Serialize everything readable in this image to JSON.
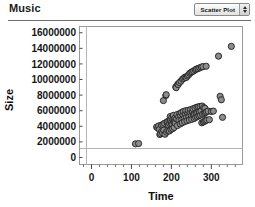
{
  "header": {
    "title": "Music",
    "plot_type": {
      "selected": "Scatter Plot",
      "stepper_up_icon": "triangle-up-icon",
      "stepper_down_icon": "triangle-down-icon"
    }
  },
  "chart_data": {
    "type": "scatter",
    "title": "Music",
    "xlabel": "Time",
    "ylabel": "Size",
    "xlim": [
      -30,
      378
    ],
    "ylim": [
      -900000,
      16800000
    ],
    "xticks": [
      0,
      100,
      200,
      300
    ],
    "xtick_labels": [
      "0",
      "100",
      "200",
      "300"
    ],
    "yticks": [
      0,
      2000000,
      4000000,
      6000000,
      8000000,
      10000000,
      12000000,
      14000000,
      16000000
    ],
    "ytick_labels": [
      "0",
      "2000000",
      "4000000",
      "6000000",
      "8000000",
      "10000000",
      "12000000",
      "14000000",
      "16000000"
    ],
    "grid": false,
    "zero_line": true,
    "legend": null,
    "marker": {
      "shape": "circle",
      "fill": "#8c8c8c",
      "edge": "#1f1f1f",
      "size": 3.1
    },
    "points": [
      [
        110,
        1750000
      ],
      [
        118,
        1790000
      ],
      [
        163,
        3900000
      ],
      [
        166,
        3780000
      ],
      [
        168,
        4050000
      ],
      [
        170,
        3600000
      ],
      [
        171,
        2950000
      ],
      [
        173,
        3050000
      ],
      [
        175,
        4150000
      ],
      [
        176,
        3350000
      ],
      [
        178,
        3150000
      ],
      [
        179,
        4250000
      ],
      [
        180,
        7300000
      ],
      [
        181,
        3500000
      ],
      [
        183,
        4400000
      ],
      [
        184,
        2980000
      ],
      [
        186,
        7950000
      ],
      [
        187,
        8050000
      ],
      [
        188,
        3250000
      ],
      [
        189,
        4500000
      ],
      [
        190,
        4600000
      ],
      [
        191,
        3450000
      ],
      [
        193,
        4150000
      ],
      [
        194,
        4700000
      ],
      [
        195,
        3400000
      ],
      [
        196,
        4350000
      ],
      [
        197,
        5250000
      ],
      [
        198,
        4800000
      ],
      [
        199,
        3600000
      ],
      [
        200,
        4450000
      ],
      [
        201,
        5100000
      ],
      [
        202,
        4250000
      ],
      [
        203,
        3700000
      ],
      [
        204,
        4900000
      ],
      [
        205,
        5400000
      ],
      [
        206,
        4550000
      ],
      [
        207,
        3850000
      ],
      [
        208,
        4650000
      ],
      [
        209,
        5050000
      ],
      [
        210,
        4400000
      ],
      [
        211,
        9050000
      ],
      [
        212,
        8950000
      ],
      [
        213,
        4950000
      ],
      [
        214,
        5500000
      ],
      [
        215,
        4100000
      ],
      [
        216,
        9400000
      ],
      [
        217,
        9350000
      ],
      [
        218,
        5200000
      ],
      [
        219,
        4750000
      ],
      [
        220,
        9600000
      ],
      [
        221,
        5650000
      ],
      [
        222,
        4300000
      ],
      [
        223,
        5350000
      ],
      [
        224,
        9800000
      ],
      [
        225,
        5750000
      ],
      [
        226,
        4850000
      ],
      [
        227,
        4450000
      ],
      [
        228,
        10050000
      ],
      [
        229,
        5450000
      ],
      [
        230,
        5900000
      ],
      [
        231,
        10150000
      ],
      [
        232,
        5000000
      ],
      [
        233,
        4600000
      ],
      [
        234,
        10300000
      ],
      [
        235,
        5600000
      ],
      [
        236,
        6000000
      ],
      [
        237,
        10250000
      ],
      [
        238,
        5150000
      ],
      [
        239,
        4700000
      ],
      [
        240,
        10450000
      ],
      [
        241,
        5700000
      ],
      [
        242,
        6050000
      ],
      [
        243,
        10600000
      ],
      [
        244,
        5250000
      ],
      [
        245,
        4800000
      ],
      [
        246,
        10800000
      ],
      [
        247,
        5800000
      ],
      [
        248,
        6150000
      ],
      [
        249,
        10900000
      ],
      [
        250,
        5350000
      ],
      [
        251,
        4900000
      ],
      [
        252,
        11000000
      ],
      [
        253,
        5900000
      ],
      [
        254,
        6250000
      ],
      [
        255,
        5450000
      ],
      [
        256,
        11100000
      ],
      [
        257,
        5000000
      ],
      [
        258,
        5550000
      ],
      [
        259,
        6350000
      ],
      [
        260,
        11250000
      ],
      [
        261,
        5150000
      ],
      [
        262,
        5650000
      ],
      [
        263,
        11350000
      ],
      [
        264,
        6450000
      ],
      [
        265,
        5250000
      ],
      [
        266,
        5750000
      ],
      [
        267,
        11400000
      ],
      [
        268,
        6500000
      ],
      [
        269,
        5350000
      ],
      [
        270,
        5850000
      ],
      [
        271,
        11500000
      ],
      [
        272,
        6550000
      ],
      [
        273,
        5450000
      ],
      [
        274,
        5950000
      ],
      [
        275,
        11600000
      ],
      [
        276,
        4450000
      ],
      [
        277,
        6600000
      ],
      [
        278,
        5550000
      ],
      [
        279,
        11650000
      ],
      [
        280,
        4550000
      ],
      [
        281,
        6400000
      ],
      [
        282,
        5650000
      ],
      [
        283,
        4650000
      ],
      [
        284,
        6300000
      ],
      [
        285,
        5750000
      ],
      [
        286,
        4750000
      ],
      [
        287,
        11700000
      ],
      [
        288,
        5850000
      ],
      [
        289,
        4800000
      ],
      [
        292,
        5950000
      ],
      [
        295,
        4850000
      ],
      [
        300,
        5900000
      ],
      [
        305,
        5950000
      ],
      [
        318,
        13000000
      ],
      [
        322,
        7850000
      ],
      [
        325,
        7400000
      ],
      [
        328,
        5150000
      ],
      [
        350,
        14250000
      ]
    ]
  }
}
